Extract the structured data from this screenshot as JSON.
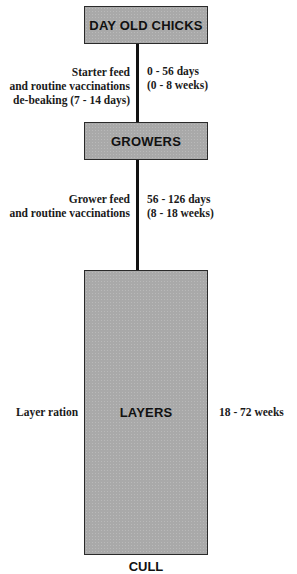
{
  "stages": [
    {
      "id": "day-old-chicks",
      "label": "DAY OLD CHICKS"
    },
    {
      "id": "growers",
      "label": "GROWERS"
    },
    {
      "id": "layers",
      "label": "LAYERS"
    },
    {
      "id": "cull",
      "label": "CULL"
    }
  ],
  "transitions": [
    {
      "left_lines": [
        "Starter feed",
        "and routine vaccinations",
        "de-beaking (7 - 14 days)"
      ],
      "right_lines": [
        "0 - 56 days",
        "(0 - 8 weeks)"
      ]
    },
    {
      "left_lines": [
        "Grower feed",
        "and routine vaccinations"
      ],
      "right_lines": [
        "56 -  126 days",
        "(8 - 18 weeks)"
      ]
    }
  ],
  "layers_annotations": {
    "left": "Layer ration",
    "right": "18 - 72 weeks"
  },
  "colors": {
    "box_fill": "#a9a9a9",
    "border": "#2a2a2a",
    "text": "#111111"
  }
}
